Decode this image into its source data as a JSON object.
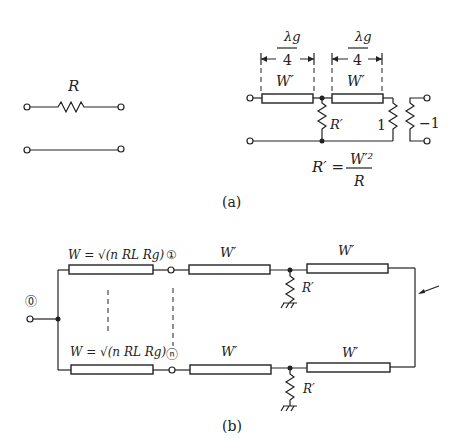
{
  "figure_a": {
    "caption": "(a)",
    "left_circuit": {
      "resistor_label": "R"
    },
    "right_circuit": {
      "dim_numerator": "λg",
      "dim_denominator": "4",
      "line1_label": "W′",
      "line2_label": "W′",
      "shunt_label": "R′",
      "load_label": "1",
      "neg_load_label": "−1",
      "formula_lhs": "R′ =",
      "formula_num": "W′²",
      "formula_den": "R"
    }
  },
  "figure_b": {
    "caption": "(b)",
    "input_port": "⓪",
    "port_1": "①",
    "port_n": "ⓝ",
    "branch_top_label": "W = √(n RL Rg)",
    "branch_bottom_label": "W = √(n RL Rg)",
    "line_labels": [
      "W′",
      "W′",
      "W′",
      "W′"
    ],
    "shunt_labels": [
      "R′",
      "R′"
    ]
  }
}
